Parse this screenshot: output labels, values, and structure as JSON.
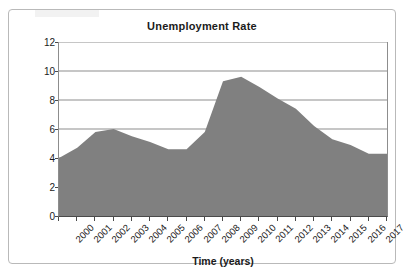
{
  "figure": {
    "title": "Unemployment Rate"
  },
  "chart_data": {
    "type": "area",
    "title": "Unemployment Rate",
    "xlabel": "Time (years)",
    "ylabel": "Unemployment Rate (percent)",
    "categories": [
      "2000",
      "2001",
      "2002",
      "2003",
      "2004",
      "2005",
      "2006",
      "2007",
      "2008",
      "2009",
      "2010",
      "2011",
      "2012",
      "2013",
      "2014",
      "2015",
      "2016",
      "2017"
    ],
    "values": [
      4.0,
      4.7,
      5.8,
      6.0,
      5.5,
      5.1,
      4.6,
      4.6,
      5.8,
      9.3,
      9.6,
      8.9,
      8.1,
      7.4,
      6.2,
      5.3,
      4.9,
      4.3
    ],
    "ylim": [
      0,
      12
    ],
    "yticks": [
      "0",
      "2",
      "4",
      "6",
      "8",
      "10",
      "12"
    ],
    "grid": "horizontal",
    "legend": "none",
    "series_name": "Unemployment Rate",
    "fill_color": "#808080",
    "gridline_color": "#8d8d8d",
    "axis_color": "#4a4a4a"
  }
}
